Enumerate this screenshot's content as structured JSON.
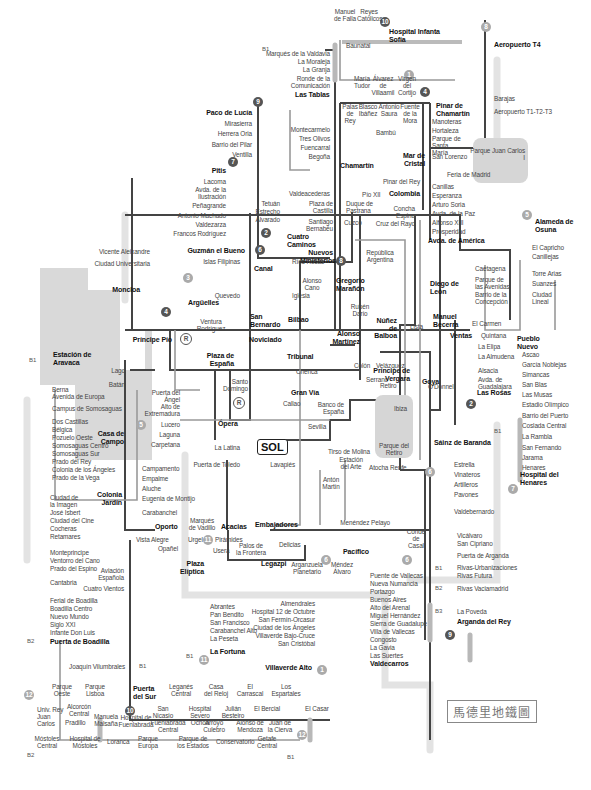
{
  "title": "馬德里地鐵圖",
  "center_label": "SOL",
  "parks": {
    "juan_carlos": "Parque Juan Carlos I",
    "retiro": "Parque del Retiro"
  },
  "line_badges": [
    "1",
    "2",
    "3",
    "4",
    "5",
    "6",
    "7",
    "8",
    "9",
    "10",
    "11",
    "12",
    "R"
  ],
  "zones": [
    "B1",
    "B2",
    "B3"
  ],
  "stations": {
    "n1": "Manuel de Falla",
    "n2": "Reyes Católicos",
    "n3": "Hospital Infanta Sofía",
    "n4": "Baunatal",
    "n5": "Marqués de la Valdavia",
    "n6": "La Moraleja",
    "n7": "La Granja",
    "n8": "Ronde de la Comunicación",
    "n9": "Las Tablas",
    "n10": "María Tudor",
    "n11": "Álvarez de Villaamil",
    "n12": "Virgen del Cortijo",
    "n13": "Palas de Rey",
    "n14": "Blasco Ibáñez",
    "n15": "Antonio Saura",
    "n16": "Fuente de la Mora",
    "n17": "Bambú",
    "n18": "Pinar de Chamartín",
    "n19": "Aeropuerto T4",
    "n20": "Barajas",
    "n21": "Aeropuerto T1-T2-T3",
    "n22": "Manoteras",
    "n23": "Hortaleza",
    "n24": "Parque de Santa María",
    "n25": "San Lorenzo",
    "n26": "Mar de Cristal",
    "n27": "Feria de Madrid",
    "n28": "Paco de Lucía",
    "n29": "Mirasierra",
    "n30": "Herrera Oria",
    "n31": "Barrio del Pilar",
    "n32": "Ventilla",
    "n33": "Montecarmelo",
    "n34": "Tres Olivos",
    "n35": "Fuencarral",
    "n36": "Begoña",
    "n37": "Chamartín",
    "n38": "Pitis",
    "n39": "Lacoma",
    "n40": "Avda. de la Ilustración",
    "n41": "Peñagrande",
    "n42": "Antonio Machado",
    "n43": "Valdezarza",
    "n44": "Francos Rodríguez",
    "n45": "Valdeacederas",
    "n46": "Tetuán",
    "n47": "Estrecho",
    "n48": "Alvarado",
    "n49": "Plaza de Castilla",
    "n50": "Duque de Pastrana",
    "n51": "Pío XII",
    "n52": "Santiago Bernabéu",
    "n53": "Cuzco",
    "n54": "Pinar del Rey",
    "n55": "Colombia",
    "n56": "Concha Espina",
    "n57": "Cruz del Rayo",
    "n58": "Canillas",
    "n59": "Esperanza",
    "n60": "Arturo Soria",
    "n61": "Avda. de la Paz",
    "n62": "Alfonso XIII",
    "n63": "Prosperidad",
    "n64": "Avda. de América",
    "n65": "Alameda de Osuna",
    "n66": "El Capricho",
    "n67": "Canillejas",
    "n68": "Torre Arias",
    "n69": "Suanzes",
    "n70": "Ciudad Lineal",
    "n71": "Cuatro Caminos",
    "n72": "Nuevos Ministerios",
    "n73": "República Argentina",
    "n74": "Guzmán el Bueno",
    "n75": "Vicente Aleixandre",
    "n76": "Ciudad Universitaria",
    "n77": "Islas Filipinas",
    "n78": "Canal",
    "n79": "Ríos Rosas",
    "n80": "Gregorio Marañón",
    "n81": "Alonso Cano",
    "n82": "Moncloa",
    "n83": "Quevedo",
    "n84": "Iglesia",
    "n85": "Argüelles",
    "n86": "San Bernardo",
    "n87": "Bilbao",
    "n88": "Rubén Darío",
    "n89": "Ventura Rodríguez",
    "n90": "Alonso Martínez",
    "n91": "Núñez de Balboa",
    "n92": "Diego de León",
    "n93": "Caetagena",
    "n94": "Parque de las Avenidas",
    "n95": "Barrio de la Concepción",
    "n96": "Lista",
    "n97": "Manuel Becerra",
    "n98": "El Carmen",
    "n99": "Quintana",
    "n100": "Ventas",
    "n101": "Pueblo Nuevo",
    "n102": "Príncipe Pío",
    "n103": "Noviciado",
    "n104": "Tribunal",
    "n105": "Colón",
    "n106": "Velázquez",
    "n107": "Serrano",
    "n108": "Goya",
    "n109": "La Elipa",
    "n110": "La Almudena",
    "n111": "Alsacia",
    "n112": "Avda. de Guadalajara",
    "n113": "Las Rosas",
    "n114": "Ascao",
    "n115": "García Noblejas",
    "n116": "Simancas",
    "n117": "San Blas",
    "n118": "Las Musas",
    "n119": "Estadio Olímpico",
    "n120": "Barrio del Puerto",
    "n121": "Coslada Central",
    "n122": "La Rambla",
    "n123": "San Fernando",
    "n124": "Jarama",
    "n125": "Henares",
    "n126": "Hospital del Henares",
    "n127": "Estación de Aravaca",
    "n128": "Lago",
    "n129": "Batán",
    "n130": "Berna",
    "n131": "Avenida de Europa",
    "n132": "Campus de Somosaguas",
    "n133": "Dos Castillas",
    "n134": "Bélgica",
    "n135": "Pozuelo Oeste",
    "n136": "Somosaguas Centro",
    "n137": "Somosaguas Sur",
    "n138": "Prado del Rey",
    "n139": "Colonia de los Ángeles",
    "n140": "Prado de la Vega",
    "n141": "Plaza de España",
    "n142": "Santo Domingo",
    "n143": "Chenca",
    "n144": "Gran Vía",
    "n145": "Callao",
    "n146": "Príncipe de Vergara",
    "n147": "Retiro",
    "n148": "Ibiza",
    "n149": "Banco de España",
    "n150": "Puerta del Ángel",
    "n151": "Alto de Extremadura",
    "n152": "Lucero",
    "n153": "Laguna",
    "n154": "Carpetana",
    "n155": "Casa de Campo",
    "n156": "Ópera",
    "n157": "Sevilla",
    "n158": "O'Donnell",
    "n159": "La Latina",
    "n160": "Puerta de Toledo",
    "n161": "Lavapiés",
    "n162": "Tirso de Molina",
    "n163": "Estación del Arte",
    "n164": "Atocha Renfe",
    "n165": "Antón Martín",
    "n166": "Sáinz de Baranda",
    "n167": "Estrella",
    "n168": "Vinateros",
    "n169": "Artilleros",
    "n170": "Pavones",
    "n171": "Valdebernardo",
    "n172": "Campamento",
    "n173": "Empalme",
    "n174": "Aluche",
    "n175": "Eugenia de Montijo",
    "n176": "Colonia Jardín",
    "n177": "Carabanchel",
    "n178": "Ciudad de la Imagen",
    "n179": "José Isbert",
    "n180": "Ciudad del Cine",
    "n181": "Cocheras",
    "n182": "Retamares",
    "n183": "Oporto",
    "n184": "Marqués de Vadillo",
    "n185": "Acacias",
    "n186": "Embajadores",
    "n187": "Menéndez Pelayo",
    "n188": "Conde de Casal",
    "n189": "Vista Alegre",
    "n190": "Urgel",
    "n191": "Pirámides",
    "n192": "Palos de la Frontera",
    "n193": "Delicias",
    "n194": "Opañel",
    "n195": "Usera",
    "n196": "Pacífico",
    "n197": "Plaza Elíptica",
    "n198": "Legazpi",
    "n199": "Arganzuela Planetario",
    "n200": "Méndez Álvaro",
    "n201": "Vicálvaro",
    "n202": "San Cipriano",
    "n203": "Puerta de Arganda",
    "n204": "Rivas-Urbanizaciones",
    "n205": "Rivas Futura",
    "n206": "Rivas Vaciamadrid",
    "n207": "La Poveda",
    "n208": "Arganda del Rey",
    "n209": "Monteprincipe",
    "n210": "Ventorro del Cano",
    "n211": "Prado del Espino",
    "n212": "Aviación Española",
    "n213": "Cantabria",
    "n214": "Cuatro Vientos",
    "n215": "Ferial de Boadilla",
    "n216": "Boadilla Centro",
    "n217": "Nuevo Mundo",
    "n218": "Siglo XXI",
    "n219": "Infante Don Luis",
    "n220": "Puerta de Boadilla",
    "n221": "Abrantes",
    "n222": "Pan Bendito",
    "n223": "San Francisco",
    "n224": "Carabanchel Alto",
    "n225": "La Peseta",
    "n226": "La Fortuna",
    "n227": "Almendrales",
    "n228": "Hospital 12 de Octubre",
    "n229": "San Fermín-Orcasur",
    "n230": "Ciudad de los Ángeles",
    "n231": "Villaverde Bajo-Cruce",
    "n232": "San Cristóbal",
    "n233": "Villaverde Alto",
    "n234": "Puente de Vallecas",
    "n235": "Nueva Numancia",
    "n236": "Portazgo",
    "n237": "Buenos Aires",
    "n238": "Alto del Arenal",
    "n239": "Miguel Hernández",
    "n240": "Sierra de Guadalupe",
    "n241": "Villa de Vallecas",
    "n242": "Congosto",
    "n243": "La Gavia",
    "n244": "Las Suertes",
    "n245": "Valdecarros",
    "n246": "Joaquín Vilumbrales",
    "n247": "Puerta del Sur",
    "n248": "Parque Oeste",
    "n249": "Parque Lisboa",
    "n250": "Leganés Central",
    "n251": "Casa del Reloj",
    "n252": "El Carrascal",
    "n253": "Los Espartales",
    "n254": "Univ. Rey Juan Carlos",
    "n255": "Alcorcón Central",
    "n256": "Pradillo",
    "n257": "Manuela Malsaña",
    "n258": "Hospital de Fuenlabrada",
    "n259": "San Nicasio",
    "n260": "Fuenlabrada Central",
    "n261": "Hospital Severo Ochoa",
    "n262": "Arroyo Culebro",
    "n263": "Julián Besteiro",
    "n264": "Alonso de Mendoza",
    "n265": "El Bercial",
    "n266": "Juan de la Cierva",
    "n267": "El Casar",
    "n268": "Móstoles Central",
    "n269": "Hospital de Móstoles",
    "n270": "Loranca",
    "n271": "Parque Europa",
    "n272": "Parque de los Estados",
    "n273": "Conservatorio",
    "n274": "Getafe Central"
  }
}
